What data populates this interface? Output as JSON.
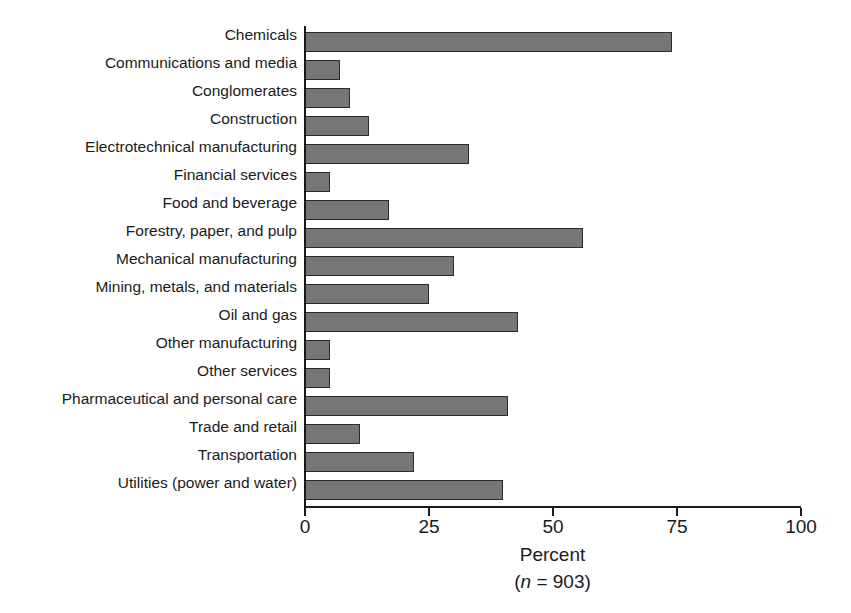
{
  "chart_data": {
    "type": "bar",
    "orientation": "horizontal",
    "title": "",
    "xlabel": "Percent",
    "xlabel_note": "(n = 903)",
    "sample_size": 903,
    "ylabel": "",
    "xlim": [
      0,
      100
    ],
    "xticks": [
      0,
      25,
      50,
      75,
      100
    ],
    "xtick_labels": [
      "0",
      "25",
      "50",
      "75",
      "100"
    ],
    "grid": false,
    "legend": false,
    "bar_color": "#767676",
    "bar_border_color": "#2b2b2b",
    "axis_color": "#1a1a1a",
    "categories": [
      "Chemicals",
      "Communications and media",
      "Conglomerates",
      "Construction",
      "Electrotechnical manufacturing",
      "Financial services",
      "Food and beverage",
      "Forestry, paper, and pulp",
      "Mechanical manufacturing",
      "Mining, metals, and materials",
      "Oil and gas",
      "Other manufacturing",
      "Other services",
      "Pharmaceutical and personal care",
      "Trade and retail",
      "Transportation",
      "Utilities (power and water)"
    ],
    "values": [
      74,
      7,
      9,
      13,
      33,
      5,
      17,
      56,
      30,
      25,
      43,
      5,
      5,
      41,
      11,
      22,
      40
    ]
  }
}
